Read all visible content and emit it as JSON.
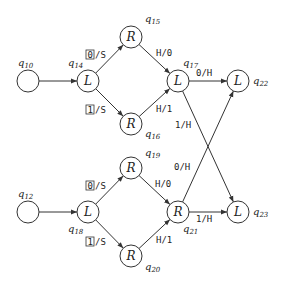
{
  "diagram": {
    "type": "state-machine",
    "states": [
      {
        "id": "q10",
        "name": "q",
        "sub": "10",
        "symbol": "",
        "x": 28,
        "y": 81,
        "lx": 18,
        "ly": 66
      },
      {
        "id": "q14",
        "name": "q",
        "sub": "14",
        "symbol": "L",
        "x": 88,
        "y": 81,
        "lx": 68,
        "ly": 66
      },
      {
        "id": "q15",
        "name": "q",
        "sub": "15",
        "symbol": "R",
        "x": 131,
        "y": 37,
        "lx": 145,
        "ly": 22
      },
      {
        "id": "q16",
        "name": "q",
        "sub": "16",
        "symbol": "R",
        "x": 131,
        "y": 124,
        "lx": 145,
        "ly": 137
      },
      {
        "id": "q17",
        "name": "q",
        "sub": "17",
        "symbol": "L",
        "x": 178,
        "y": 81,
        "lx": 183,
        "ly": 66
      },
      {
        "id": "q22",
        "name": "q",
        "sub": "22",
        "symbol": "L",
        "x": 238,
        "y": 81,
        "lx": 253,
        "ly": 84
      },
      {
        "id": "q12",
        "name": "q",
        "sub": "12",
        "symbol": "",
        "x": 28,
        "y": 212,
        "lx": 18,
        "ly": 197
      },
      {
        "id": "q18",
        "name": "q",
        "sub": "18",
        "symbol": "L",
        "x": 88,
        "y": 212,
        "lx": 68,
        "ly": 232
      },
      {
        "id": "q19",
        "name": "q",
        "sub": "19",
        "symbol": "R",
        "x": 131,
        "y": 168,
        "lx": 145,
        "ly": 156
      },
      {
        "id": "q20",
        "name": "q",
        "sub": "20",
        "symbol": "R",
        "x": 131,
        "y": 256,
        "lx": 145,
        "ly": 270
      },
      {
        "id": "q21",
        "name": "q",
        "sub": "21",
        "symbol": "R",
        "x": 178,
        "y": 212,
        "lx": 183,
        "ly": 232
      },
      {
        "id": "q23",
        "name": "q",
        "sub": "23",
        "symbol": "L",
        "x": 238,
        "y": 212,
        "lx": 253,
        "ly": 215
      }
    ],
    "transitions": [
      {
        "from": "q10",
        "to": "q14",
        "label": "",
        "lx": 0,
        "ly": 0
      },
      {
        "from": "q14",
        "to": "q15",
        "read": "0",
        "label": "/S",
        "boxed": true,
        "lx": 86,
        "ly": 58
      },
      {
        "from": "q14",
        "to": "q16",
        "read": "1",
        "label": "/S",
        "boxed": true,
        "lx": 86,
        "ly": 113
      },
      {
        "from": "q15",
        "to": "q17",
        "label": "H/0",
        "lx": 156,
        "ly": 56
      },
      {
        "from": "q16",
        "to": "q17",
        "label": "H/1",
        "lx": 156,
        "ly": 112
      },
      {
        "from": "q17",
        "to": "q22",
        "label": "0/H",
        "lx": 196,
        "ly": 76
      },
      {
        "from": "q17",
        "to": "q23",
        "label": "1/H",
        "lx": 175,
        "ly": 128
      },
      {
        "from": "q12",
        "to": "q18",
        "label": "",
        "lx": 0,
        "ly": 0
      },
      {
        "from": "q18",
        "to": "q19",
        "read": "0",
        "label": "/S",
        "boxed": true,
        "lx": 86,
        "ly": 189
      },
      {
        "from": "q18",
        "to": "q20",
        "read": "1",
        "label": "/S",
        "boxed": true,
        "lx": 86,
        "ly": 245
      },
      {
        "from": "q19",
        "to": "q21",
        "label": "H/0",
        "lx": 155,
        "ly": 187
      },
      {
        "from": "q20",
        "to": "q21",
        "label": "H/1",
        "lx": 156,
        "ly": 243
      },
      {
        "from": "q21",
        "to": "q22",
        "label": "0/H",
        "lx": 174,
        "ly": 170
      },
      {
        "from": "q21",
        "to": "q23",
        "label": "1/H",
        "lx": 196,
        "ly": 222
      }
    ]
  }
}
